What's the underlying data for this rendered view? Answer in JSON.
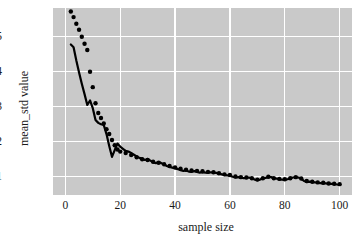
{
  "chart_data": {
    "type": "line",
    "title": "",
    "xlabel": "sample size",
    "ylabel": "mean_std value",
    "xlim": [
      -4.5,
      104.5
    ],
    "ylim": [
      0.048,
      0.582
    ],
    "grid": true,
    "grid_color": "#ffffff",
    "axes_facecolor": "#c9c9c9",
    "figure_facecolor": "#ffffff",
    "legend_position": "none",
    "xticks": [
      0,
      20,
      40,
      60,
      80,
      100
    ],
    "xticklabels": [
      "0",
      "20",
      "40",
      "60",
      "80",
      "100"
    ],
    "yticks": [
      0.1,
      0.2,
      0.3,
      0.4,
      0.5
    ],
    "yticklabels": [
      "0.1",
      "0.2",
      "0.3",
      "0.4",
      "0.5"
    ],
    "series": [
      {
        "name": "mean_std (solid)",
        "style": "solid-line",
        "color": "#000000",
        "linewidth": 2.2,
        "x": [
          2,
          3,
          4,
          5,
          6,
          7,
          8,
          9,
          10,
          11,
          12,
          13,
          14,
          15,
          16,
          17,
          18,
          19,
          20,
          21,
          22,
          23,
          24,
          25,
          26,
          27,
          28,
          29,
          30,
          31,
          32,
          33,
          34,
          35,
          36,
          37,
          38,
          39,
          40,
          41,
          42,
          43,
          44,
          45,
          46,
          47,
          48,
          49,
          50,
          51,
          52,
          53,
          54,
          55,
          56,
          57,
          58,
          59,
          60,
          61,
          62,
          63,
          64,
          65,
          66,
          67,
          68,
          69,
          70,
          71,
          72,
          73,
          74,
          75,
          76,
          77,
          78,
          79,
          80,
          81,
          82,
          83,
          84,
          85,
          86,
          87,
          88,
          89,
          90,
          91,
          92,
          93,
          94,
          95,
          96,
          97,
          98,
          99,
          100
        ],
        "y": [
          0.478,
          0.47,
          0.432,
          0.398,
          0.366,
          0.336,
          0.305,
          0.318,
          0.296,
          0.262,
          0.254,
          0.25,
          0.248,
          0.222,
          0.188,
          0.157,
          0.176,
          0.195,
          0.186,
          0.18,
          0.174,
          0.172,
          0.168,
          0.163,
          0.158,
          0.154,
          0.152,
          0.148,
          0.151,
          0.146,
          0.141,
          0.139,
          0.142,
          0.139,
          0.135,
          0.131,
          0.128,
          0.126,
          0.124,
          0.122,
          0.119,
          0.117,
          0.118,
          0.115,
          0.114,
          0.116,
          0.114,
          0.112,
          0.113,
          0.112,
          0.112,
          0.113,
          0.112,
          0.111,
          0.109,
          0.107,
          0.105,
          0.104,
          0.103,
          0.1,
          0.098,
          0.099,
          0.098,
          0.096,
          0.097,
          0.098,
          0.095,
          0.092,
          0.09,
          0.092,
          0.095,
          0.097,
          0.099,
          0.099,
          0.096,
          0.095,
          0.093,
          0.092,
          0.091,
          0.093,
          0.096,
          0.098,
          0.099,
          0.098,
          0.094,
          0.088,
          0.085,
          0.086,
          0.085,
          0.084,
          0.083,
          0.082,
          0.081,
          0.081,
          0.08,
          0.08,
          0.079,
          0.078,
          0.077
        ]
      },
      {
        "name": "mean_std (dotted)",
        "style": "dotted-markers",
        "color": "#000000",
        "markersize": 2.2,
        "x": [
          2,
          3,
          4,
          5,
          6,
          7,
          8,
          9,
          10,
          11,
          12,
          13,
          14,
          15,
          16,
          17,
          18,
          19,
          20,
          22,
          24,
          26,
          28,
          30,
          32,
          34,
          36,
          38,
          40,
          42,
          44,
          46,
          48,
          50,
          52,
          54,
          56,
          58,
          60,
          62,
          64,
          66,
          68,
          70,
          72,
          74,
          76,
          78,
          80,
          82,
          84,
          86,
          88,
          90,
          92,
          94,
          96,
          98,
          100
        ],
        "y": [
          0.572,
          0.556,
          0.537,
          0.52,
          0.5,
          0.48,
          0.462,
          0.4,
          0.356,
          0.31,
          0.282,
          0.268,
          0.252,
          0.236,
          0.222,
          0.205,
          0.19,
          0.178,
          0.172,
          0.168,
          0.162,
          0.156,
          0.15,
          0.148,
          0.143,
          0.14,
          0.136,
          0.131,
          0.127,
          0.123,
          0.12,
          0.118,
          0.117,
          0.116,
          0.114,
          0.113,
          0.11,
          0.107,
          0.105,
          0.101,
          0.099,
          0.098,
          0.096,
          0.092,
          0.096,
          0.1,
          0.096,
          0.094,
          0.093,
          0.096,
          0.099,
          0.095,
          0.088,
          0.086,
          0.084,
          0.083,
          0.081,
          0.08,
          0.079
        ]
      }
    ]
  }
}
